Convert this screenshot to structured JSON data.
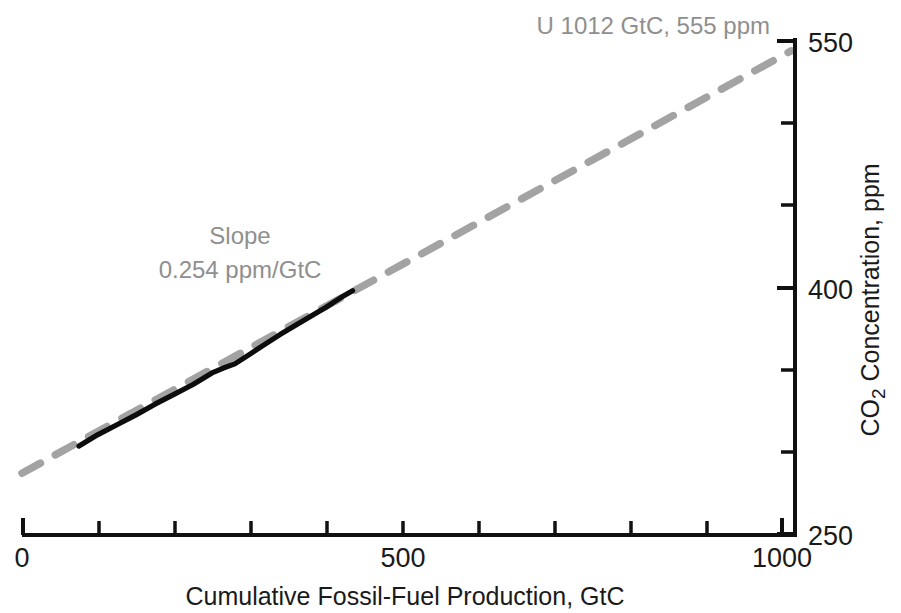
{
  "chart_data": {
    "type": "line",
    "title": "",
    "xlabel": "Cumulative Fossil-Fuel Production, GtC",
    "ylabel": "CO2 Concentration, ppm",
    "ylabel_parts": {
      "pre": "CO",
      "sub": "2",
      "post": " Concentration, ppm"
    },
    "xlim": [
      0,
      1000
    ],
    "ylim": [
      250,
      550
    ],
    "grid": false,
    "legend": "none",
    "y_axis_position": "right",
    "x_ticks": [
      0,
      100,
      200,
      300,
      400,
      500,
      600,
      700,
      800,
      900,
      1000
    ],
    "x_tick_labels": [
      "0",
      "",
      "",
      "",
      "",
      "500",
      "",
      "",
      "",
      "",
      "1000"
    ],
    "y_ticks": [
      250,
      300,
      350,
      400,
      450,
      500,
      550
    ],
    "y_tick_labels": [
      "250",
      "",
      "",
      "400",
      "",
      "",
      "550"
    ],
    "series": [
      {
        "name": "Linear projection (slope 0.254 ppm/GtC)",
        "style": "dashed",
        "color": "#a3a3a3",
        "x": [
          0,
          1012
        ],
        "values": [
          287.0,
          544.0
        ],
        "slope_ppm_per_gtc": 0.254,
        "endpoint_label": "U 1012 GtC, 555 ppm"
      },
      {
        "name": "Observed CO2 vs cumulative production",
        "style": "solid",
        "color": "#0d0d0d",
        "x": [
          75,
          100,
          125,
          150,
          175,
          200,
          225,
          250,
          265,
          280,
          300,
          320,
          340,
          360,
          380,
          400,
          420,
          435
        ],
        "values": [
          303.5,
          310.5,
          316.5,
          322.5,
          329.0,
          335.0,
          341.0,
          348.0,
          351.0,
          353.5,
          359.5,
          365.5,
          371.5,
          377.0,
          382.5,
          388.0,
          394.0,
          398.0
        ]
      }
    ],
    "annotations": [
      {
        "name": "slope-annotation",
        "line1": "Slope",
        "line2": "0.254 ppm/GtC",
        "color": "#8f8f8f"
      },
      {
        "name": "ultimate-resource-annotation",
        "symbol": "U",
        "text": " 1012 GtC, 555 ppm",
        "color": "#8f8f8f"
      }
    ],
    "colors": {
      "projection": "#a3a3a3",
      "observed": "#0d0d0d",
      "axis": "#111111",
      "annotation": "#8f8f8f",
      "background": "#ffffff"
    }
  }
}
